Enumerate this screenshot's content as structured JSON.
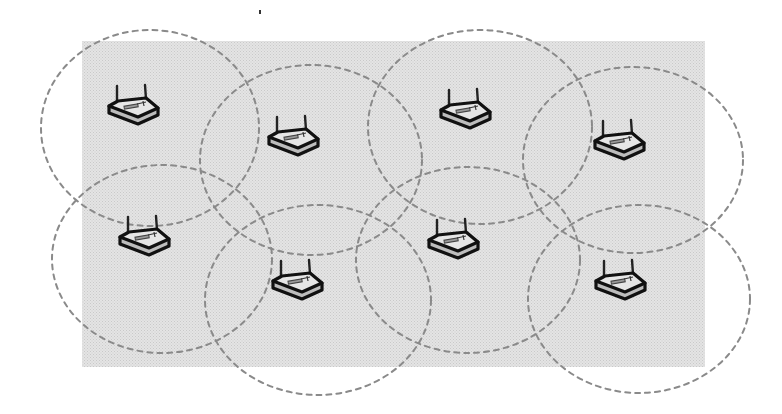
{
  "diagram": {
    "title": "",
    "colors": {
      "background": "#ffffff",
      "coverage_area_fill": "#e4e4e4",
      "coverage_area_dot": "#c9c9c9",
      "range_circle_stroke": "#8a8a8a",
      "router_outline": "#111111",
      "router_top": "#e6e6e6",
      "router_side": "#bdbdbd"
    },
    "coverage_area": {
      "x": 82,
      "y": 41,
      "width": 623,
      "height": 326
    },
    "stray_mark": {
      "x": 259,
      "y": 10
    },
    "icon": "wireless-router-icon",
    "nodes": [
      {
        "id": "router-1",
        "row": 1,
        "col": 1,
        "router": {
          "x": 106,
          "y": 85
        },
        "range": {
          "cx": 150,
          "cy": 128,
          "rx": 109,
          "ry": 98
        }
      },
      {
        "id": "router-2",
        "row": 1,
        "col": 2,
        "router": {
          "x": 266,
          "y": 116
        },
        "range": {
          "cx": 311,
          "cy": 160,
          "rx": 111,
          "ry": 95
        }
      },
      {
        "id": "router-3",
        "row": 1,
        "col": 3,
        "router": {
          "x": 438,
          "y": 89
        },
        "range": {
          "cx": 480,
          "cy": 127,
          "rx": 112,
          "ry": 97
        }
      },
      {
        "id": "router-4",
        "row": 1,
        "col": 4,
        "router": {
          "x": 592,
          "y": 120
        },
        "range": {
          "cx": 633,
          "cy": 160,
          "rx": 110,
          "ry": 93
        }
      },
      {
        "id": "router-5",
        "row": 2,
        "col": 1,
        "router": {
          "x": 117,
          "y": 216
        },
        "range": {
          "cx": 162,
          "cy": 259,
          "rx": 110,
          "ry": 94
        }
      },
      {
        "id": "router-6",
        "row": 2,
        "col": 2,
        "router": {
          "x": 270,
          "y": 260
        },
        "range": {
          "cx": 318,
          "cy": 300,
          "rx": 113,
          "ry": 95
        }
      },
      {
        "id": "router-7",
        "row": 2,
        "col": 3,
        "router": {
          "x": 426,
          "y": 219
        },
        "range": {
          "cx": 468,
          "cy": 260,
          "rx": 112,
          "ry": 93
        }
      },
      {
        "id": "router-8",
        "row": 2,
        "col": 4,
        "router": {
          "x": 593,
          "y": 260
        },
        "range": {
          "cx": 639,
          "cy": 299,
          "rx": 111,
          "ry": 94
        }
      }
    ]
  }
}
